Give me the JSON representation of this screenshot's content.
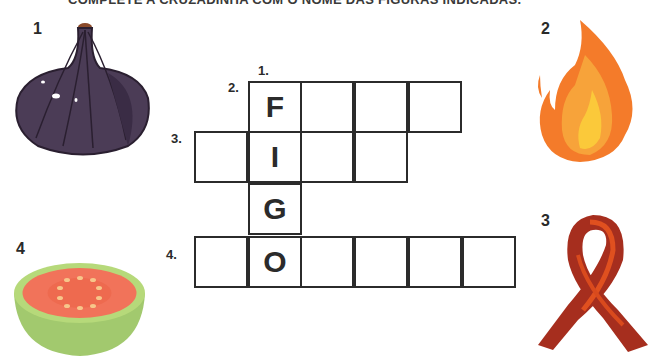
{
  "instruction": "COMPLETE A CRUZADINHA COM O NOME DAS FIGURAS INDICADAS.",
  "figures": [
    {
      "number": "1",
      "name": "fig-icon",
      "color": "#4a3a55"
    },
    {
      "number": "2",
      "name": "fire-icon",
      "color": "#f47b2a"
    },
    {
      "number": "3",
      "name": "ribbon-icon",
      "color": "#b8321f"
    },
    {
      "number": "4",
      "name": "guava-icon",
      "color": "#9bc46a"
    }
  ],
  "crossword": {
    "clue_labels": [
      "1.",
      "2.",
      "3.",
      "4."
    ],
    "given_letters": [
      "F",
      "I",
      "G",
      "O"
    ],
    "rows": [
      {
        "clue": "2.",
        "length": 4,
        "start_col": 1
      },
      {
        "clue": "3.",
        "length": 4,
        "start_col": 0
      },
      {
        "clue": "",
        "length": 1,
        "start_col": 1
      },
      {
        "clue": "4.",
        "length": 6,
        "start_col": 0
      }
    ]
  }
}
